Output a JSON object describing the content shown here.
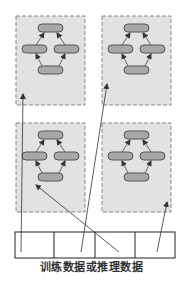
{
  "caption": "训练数据或推理数据",
  "colors": {
    "box_fill": "#e2e2e2",
    "box_border": "#888888",
    "node_fill": "#a8a8a8",
    "node_border": "#555555",
    "arrow": "#444444",
    "bar_border": "#222222"
  },
  "models": [
    {
      "name": "model-top-left"
    },
    {
      "name": "model-top-right"
    },
    {
      "name": "model-bottom-left"
    },
    {
      "name": "model-bottom-right"
    }
  ],
  "data_bar": {
    "cells": 4
  }
}
